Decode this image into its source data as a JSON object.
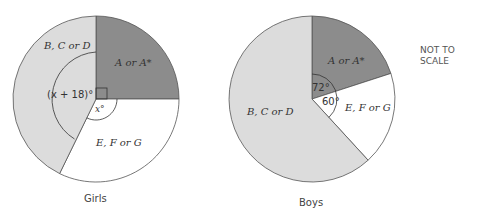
{
  "girls": {
    "caption": "Girls",
    "sectors": [
      {
        "label": "A or A*",
        "angle_label": "",
        "angle": 90,
        "color": "#8c8c8c"
      },
      {
        "label": "E, F or G",
        "angle_label": "x°",
        "angle": 126,
        "color": "#ffffff"
      },
      {
        "label": "B, C or D",
        "angle_label": "(x + 18)°",
        "angle": 144,
        "color": "#dcdcdc"
      }
    ]
  },
  "boys": {
    "caption": "Boys",
    "sectors": [
      {
        "label": "A or A*",
        "angle_label": "72°",
        "angle": 72,
        "color": "#8c8c8c"
      },
      {
        "label": "E, F or G",
        "angle_label": "60°",
        "angle": 60,
        "color": "#ffffff"
      },
      {
        "label": "B, C or D",
        "angle_label": "",
        "angle": 228,
        "color": "#dcdcdc"
      }
    ]
  },
  "note": [
    "NOT TO",
    "SCALE"
  ]
}
